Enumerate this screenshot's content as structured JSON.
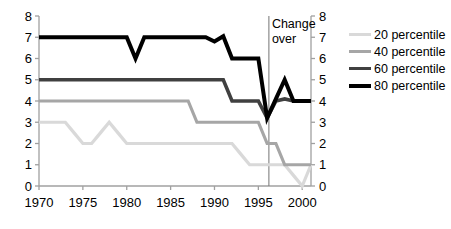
{
  "chart_data": {
    "type": "line",
    "title": "",
    "xlabel": "",
    "ylabel": "",
    "xlim": [
      1970,
      2001
    ],
    "ylim": [
      0,
      8
    ],
    "grid": false,
    "legend_position": "right",
    "x_ticks": [
      "1970",
      "1975",
      "1980",
      "1985",
      "1990",
      "1995",
      "2000"
    ],
    "x_tick_values": [
      1970,
      1975,
      1980,
      1985,
      1990,
      1995,
      2000
    ],
    "y_ticks_left": [
      "8",
      "7",
      "6",
      "5",
      "4",
      "3",
      "2",
      "1",
      "0"
    ],
    "y_ticks_right": [
      "8",
      "7",
      "6",
      "5",
      "4",
      "3",
      "2",
      "1",
      "0"
    ],
    "y_tick_values": [
      8,
      7,
      6,
      5,
      4,
      3,
      2,
      1,
      0
    ],
    "annotations": [
      {
        "name": "change-over",
        "line1": "Change",
        "line2": "over",
        "x_value": 1996.2,
        "type": "vertical-line-with-label"
      }
    ],
    "x": [
      1970,
      1971,
      1972,
      1973,
      1974,
      1975,
      1976,
      1977,
      1978,
      1979,
      1980,
      1981,
      1982,
      1983,
      1984,
      1985,
      1986,
      1987,
      1988,
      1989,
      1990,
      1991,
      1992,
      1993,
      1994,
      1995,
      1996,
      1997,
      1998,
      1999,
      2000,
      2001
    ],
    "series": [
      {
        "name": "20 percentile",
        "color": "#d9d9d9",
        "width": 3.2,
        "values": [
          3,
          3,
          3,
          3,
          2.5,
          2,
          2,
          2.5,
          3,
          2.5,
          2,
          2,
          2,
          2,
          2,
          2,
          2,
          2,
          2,
          2,
          2,
          2,
          2,
          1.5,
          1,
          1,
          1,
          1,
          1,
          0.5,
          0,
          1
        ]
      },
      {
        "name": "40 percentile",
        "color": "#a6a6a6",
        "width": 3.2,
        "values": [
          4,
          4,
          4,
          4,
          4,
          4,
          4,
          4,
          4,
          4,
          4,
          4,
          4,
          4,
          4,
          4,
          4,
          4,
          3,
          3,
          3,
          3,
          3,
          3,
          3,
          3,
          2,
          2,
          1,
          1,
          1,
          1
        ]
      },
      {
        "name": "60 percentile",
        "color": "#404040",
        "width": 3.6,
        "values": [
          5,
          5,
          5,
          5,
          5,
          5,
          5,
          5,
          5,
          5,
          5,
          5,
          5,
          5,
          5,
          5,
          5,
          5,
          5,
          5,
          5,
          5,
          4,
          4,
          4,
          4,
          3.2,
          4,
          4.1,
          4,
          4,
          4
        ]
      },
      {
        "name": "80 percentile",
        "color": "#000000",
        "width": 4.0,
        "values": [
          7,
          7,
          7,
          7,
          7,
          7,
          7,
          7,
          7,
          7,
          7,
          6,
          7,
          7,
          7,
          7,
          7,
          7,
          7,
          7,
          6.8,
          7.05,
          6,
          6,
          6,
          6,
          3.2,
          4.1,
          5,
          4,
          4,
          4
        ]
      }
    ]
  },
  "legend": {
    "items": [
      {
        "label": "20 percentile",
        "color": "#d9d9d9",
        "width": 3.2
      },
      {
        "label": "40 percentile",
        "color": "#a6a6a6",
        "width": 3.2
      },
      {
        "label": "60 percentile",
        "color": "#404040",
        "width": 3.6
      },
      {
        "label": "80 percentile",
        "color": "#000000",
        "width": 4.0
      }
    ]
  },
  "colors": {
    "axis": "#a0a0a0",
    "text": "#000000",
    "background": "#ffffff",
    "annotation_line": "#808080"
  }
}
